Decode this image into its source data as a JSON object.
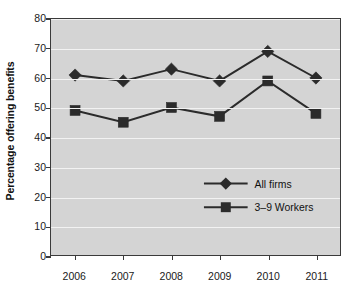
{
  "chart_data": {
    "type": "line",
    "title": "",
    "xlabel": "",
    "ylabel": "Percentage offering benefits",
    "categories": [
      "2006",
      "2007",
      "2008",
      "2009",
      "2010",
      "2011"
    ],
    "series": [
      {
        "name": "All firms",
        "marker": "diamond",
        "color": "#2b2b2b",
        "values": [
          61,
          59,
          63,
          59,
          69,
          60
        ]
      },
      {
        "name": "3–9 Workers",
        "marker": "square",
        "color": "#2b2b2b",
        "values": [
          49,
          45,
          50,
          47,
          59,
          48
        ]
      }
    ],
    "ylim": [
      0,
      80
    ],
    "yticks": [
      0,
      10,
      20,
      30,
      40,
      50,
      60,
      70,
      80
    ],
    "ytick_labels": [
      "0",
      "10",
      "20",
      "30",
      "40",
      "50",
      "60",
      "70",
      "80"
    ],
    "grid": true,
    "grid_color": "#f2f2f2",
    "legend_position": "center-right-inside",
    "plot_background": "#d4d4d4",
    "figure_background": "#ffffff",
    "axis_color": "#3a3a3a"
  },
  "legend": {
    "entries": [
      {
        "label": "All firms",
        "marker": "diamond-icon"
      },
      {
        "label": "3–9 Workers",
        "marker": "square-icon"
      }
    ]
  }
}
